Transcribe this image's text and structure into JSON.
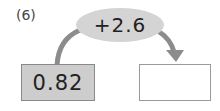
{
  "problem": {
    "number_label": "(6)",
    "operation": "+2.6",
    "start_value": "0.82",
    "result_value": ""
  },
  "colors": {
    "arrow": "#8c8c8c",
    "operation_fill": "#d4d4d4",
    "start_box_fill": "#cdcdcd",
    "result_box_fill": "#ffffff"
  }
}
